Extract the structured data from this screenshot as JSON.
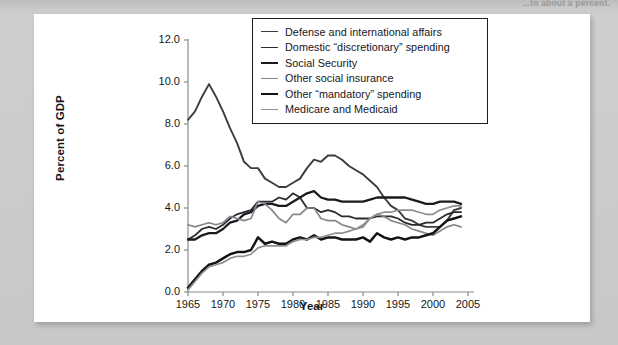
{
  "page": {
    "clipped_header_text": "...to about a percent."
  },
  "chart_data": {
    "type": "line",
    "title": "",
    "xlabel": "Year",
    "ylabel": "Percent of GDP",
    "xlim": [
      1965,
      2005
    ],
    "ylim": [
      0.0,
      12.0
    ],
    "xticks": [
      "1965",
      "1970",
      "1975",
      "1980",
      "1985",
      "1990",
      "1995",
      "2000",
      "2005"
    ],
    "yticks": [
      "0.0",
      "2.0",
      "4.0",
      "6.0",
      "8.0",
      "10.0",
      "12.0"
    ],
    "grid": false,
    "legend_position": "top-right",
    "x": [
      1965,
      1966,
      1967,
      1968,
      1969,
      1970,
      1971,
      1972,
      1973,
      1974,
      1975,
      1976,
      1977,
      1978,
      1979,
      1980,
      1981,
      1982,
      1983,
      1984,
      1985,
      1986,
      1987,
      1988,
      1989,
      1990,
      1991,
      1992,
      1993,
      1994,
      1995,
      1996,
      1997,
      1998,
      1999,
      2000,
      2001,
      2002,
      2003,
      2004
    ],
    "series": [
      {
        "name": "Defense and international affairs",
        "color": "#3b3c40",
        "width": 1.9,
        "values": [
          8.2,
          8.6,
          9.3,
          9.9,
          9.3,
          8.6,
          7.8,
          7.1,
          6.2,
          5.9,
          5.9,
          5.4,
          5.2,
          5.0,
          5.0,
          5.2,
          5.4,
          5.9,
          6.3,
          6.2,
          6.5,
          6.5,
          6.3,
          6.0,
          5.8,
          5.6,
          5.3,
          5.0,
          4.5,
          4.1,
          3.9,
          3.5,
          3.4,
          3.2,
          3.1,
          3.1,
          3.1,
          3.4,
          3.9,
          4.0
        ]
      },
      {
        "name": "Domestic “discretionary” spending",
        "color": "#2a2b2f",
        "width": 1.8,
        "values": [
          2.5,
          2.7,
          3.0,
          3.1,
          3.0,
          3.2,
          3.5,
          3.7,
          3.8,
          3.9,
          4.3,
          4.3,
          4.3,
          4.5,
          4.4,
          4.7,
          4.5,
          4.0,
          4.0,
          3.8,
          3.9,
          3.8,
          3.6,
          3.6,
          3.5,
          3.5,
          3.5,
          3.6,
          3.6,
          3.6,
          3.5,
          3.3,
          3.2,
          3.2,
          3.3,
          3.3,
          3.5,
          3.7,
          3.8,
          3.8
        ]
      },
      {
        "name": "Social Security",
        "color": "#1a1b1f",
        "width": 2.3,
        "values": [
          2.5,
          2.5,
          2.7,
          2.8,
          2.8,
          3.0,
          3.3,
          3.4,
          3.7,
          3.8,
          4.1,
          4.2,
          4.2,
          4.1,
          4.1,
          4.3,
          4.5,
          4.7,
          4.8,
          4.5,
          4.4,
          4.4,
          4.3,
          4.3,
          4.3,
          4.3,
          4.4,
          4.5,
          4.5,
          4.5,
          4.5,
          4.5,
          4.4,
          4.3,
          4.2,
          4.2,
          4.3,
          4.3,
          4.3,
          4.2
        ]
      },
      {
        "name": "Other social insurance",
        "color": "#86878b",
        "width": 1.7,
        "values": [
          3.2,
          3.1,
          3.2,
          3.3,
          3.2,
          3.3,
          3.6,
          3.5,
          3.4,
          3.5,
          4.3,
          4.2,
          3.9,
          3.5,
          3.3,
          3.7,
          3.7,
          4.0,
          4.0,
          3.5,
          3.4,
          3.4,
          3.2,
          3.1,
          3.0,
          3.1,
          3.5,
          3.7,
          3.6,
          3.4,
          3.3,
          3.2,
          3.0,
          2.9,
          2.8,
          2.7,
          2.9,
          3.1,
          3.2,
          3.1
        ]
      },
      {
        "name": "Other “mandatory” spending",
        "color": "#121317",
        "width": 2.5,
        "values": [
          0.2,
          0.6,
          1.0,
          1.3,
          1.4,
          1.6,
          1.8,
          1.9,
          1.9,
          2.0,
          2.6,
          2.3,
          2.4,
          2.3,
          2.3,
          2.5,
          2.6,
          2.5,
          2.7,
          2.5,
          2.6,
          2.6,
          2.5,
          2.5,
          2.5,
          2.6,
          2.4,
          2.8,
          2.6,
          2.5,
          2.6,
          2.5,
          2.6,
          2.6,
          2.7,
          2.8,
          3.1,
          3.4,
          3.5,
          3.6
        ]
      },
      {
        "name": "Medicare and Medicaid",
        "color": "#8e8f93",
        "width": 1.7,
        "values": [
          0.1,
          0.5,
          0.9,
          1.2,
          1.3,
          1.4,
          1.6,
          1.7,
          1.7,
          1.8,
          2.1,
          2.2,
          2.2,
          2.2,
          2.2,
          2.4,
          2.5,
          2.5,
          2.6,
          2.6,
          2.7,
          2.8,
          2.8,
          2.9,
          3.0,
          3.2,
          3.5,
          3.7,
          3.8,
          3.8,
          3.9,
          3.9,
          3.9,
          3.8,
          3.7,
          3.7,
          3.9,
          4.0,
          4.1,
          4.1
        ]
      }
    ]
  }
}
